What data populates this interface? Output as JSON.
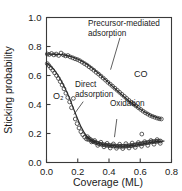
{
  "chart_data": {
    "type": "scatter",
    "title": "",
    "xlabel": "Coverage (ML)",
    "ylabel": "Sticking probability",
    "xlim": [
      0.0,
      0.8
    ],
    "ylim": [
      0.0,
      1.0
    ],
    "xticks": [
      "0.0",
      "0.2",
      "0.4",
      "0.6",
      "0.8"
    ],
    "xtick_values": [
      0.0,
      0.2,
      0.4,
      0.6,
      0.8
    ],
    "yticks": [
      "0.0",
      "0.2",
      "0.4",
      "0.6",
      "0.8",
      "1.0"
    ],
    "ytick_values": [
      0.0,
      0.2,
      0.4,
      0.6,
      0.8,
      1.0
    ],
    "grid": false,
    "legend_position": "none",
    "marker_style": "open-circle",
    "annotations": [
      {
        "name": "precursor-mediated-adsorption",
        "text_line_1": "Precursor-mediated",
        "text_line_2": "adsorption",
        "text": "Precursor-mediated adsorption",
        "leader_from": [
          0.47,
          0.86
        ],
        "leader_to": [
          0.41,
          0.64
        ]
      },
      {
        "name": "direct-adsorption",
        "text_line_1": "Direct",
        "text_line_2": "adsorption",
        "text": "Direct adsorption",
        "leader_from": [
          0.235,
          0.42
        ],
        "leader_to": [
          0.175,
          0.33
        ]
      },
      {
        "name": "oxidation",
        "text_line_1": "Oxidation",
        "text": "Oxidation",
        "leader_from": [
          0.45,
          0.3
        ],
        "leader_to": [
          0.435,
          0.175
        ]
      }
    ],
    "series": [
      {
        "name": "CO",
        "label": "CO",
        "label_position": [
          0.565,
          0.515
        ],
        "mechanism": "Precursor-mediated adsorption",
        "x": [
          0.005,
          0.018,
          0.032,
          0.047,
          0.062,
          0.078,
          0.093,
          0.108,
          0.122,
          0.137,
          0.152,
          0.168,
          0.183,
          0.198,
          0.213,
          0.228,
          0.243,
          0.258,
          0.273,
          0.288,
          0.303,
          0.318,
          0.333,
          0.348,
          0.363,
          0.378,
          0.393,
          0.408,
          0.423,
          0.438,
          0.453,
          0.468,
          0.483,
          0.498,
          0.513,
          0.528,
          0.543,
          0.558,
          0.573,
          0.588,
          0.603,
          0.618,
          0.633,
          0.648,
          0.663,
          0.678,
          0.693,
          0.708,
          0.722,
          0.735
        ],
        "y": [
          0.748,
          0.745,
          0.752,
          0.742,
          0.748,
          0.738,
          0.755,
          0.742,
          0.735,
          0.738,
          0.728,
          0.722,
          0.715,
          0.71,
          0.702,
          0.692,
          0.682,
          0.672,
          0.66,
          0.648,
          0.636,
          0.622,
          0.61,
          0.596,
          0.582,
          0.568,
          0.553,
          0.54,
          0.526,
          0.512,
          0.498,
          0.484,
          0.47,
          0.456,
          0.442,
          0.428,
          0.414,
          0.402,
          0.39,
          0.378,
          0.366,
          0.354,
          0.343,
          0.334,
          0.325,
          0.318,
          0.312,
          0.306,
          0.302,
          0.3
        ],
        "fit_curve": [
          [
            0.0,
            0.748
          ],
          [
            0.1,
            0.744
          ],
          [
            0.18,
            0.722
          ],
          [
            0.26,
            0.678
          ],
          [
            0.34,
            0.608
          ],
          [
            0.42,
            0.528
          ],
          [
            0.5,
            0.45
          ],
          [
            0.58,
            0.382
          ],
          [
            0.66,
            0.33
          ],
          [
            0.735,
            0.3
          ]
        ]
      },
      {
        "name": "O2",
        "label": "O₂",
        "label_position": [
          0.105,
          0.345
        ],
        "mechanism": "Direct adsorption",
        "x": [
          0.005,
          0.016,
          0.028,
          0.04,
          0.052,
          0.064,
          0.076,
          0.088,
          0.1,
          0.112,
          0.124,
          0.136,
          0.148,
          0.16,
          0.172,
          0.184,
          0.196,
          0.208,
          0.22,
          0.232,
          0.244,
          0.256
        ],
        "y": [
          0.682,
          0.668,
          0.652,
          0.636,
          0.618,
          0.6,
          0.58,
          0.558,
          0.534,
          0.508,
          0.478,
          0.448,
          0.418,
          0.378,
          0.442,
          0.3,
          0.268,
          0.238,
          0.212,
          0.192,
          0.175,
          0.162
        ],
        "fit_curve": [
          [
            0.0,
            0.688
          ],
          [
            0.05,
            0.638
          ],
          [
            0.1,
            0.552
          ],
          [
            0.14,
            0.462
          ],
          [
            0.18,
            0.352
          ],
          [
            0.22,
            0.248
          ],
          [
            0.26,
            0.178
          ],
          [
            0.3,
            0.148
          ],
          [
            0.34,
            0.138
          ]
        ]
      },
      {
        "name": "oxidation-plateau",
        "label": "",
        "mechanism": "Oxidation",
        "x": [
          0.262,
          0.272,
          0.282,
          0.292,
          0.3,
          0.31,
          0.32,
          0.33,
          0.34,
          0.35,
          0.36,
          0.37,
          0.38,
          0.39,
          0.4,
          0.41,
          0.42,
          0.43,
          0.44,
          0.45,
          0.46,
          0.47,
          0.48,
          0.49,
          0.5,
          0.51,
          0.52,
          0.53,
          0.54,
          0.55,
          0.56,
          0.57,
          0.58,
          0.59,
          0.6,
          0.61,
          0.62,
          0.63,
          0.64,
          0.65,
          0.66,
          0.67,
          0.68,
          0.69,
          0.7,
          0.71,
          0.72,
          0.73,
          0.268,
          0.288,
          0.308,
          0.328,
          0.348,
          0.368,
          0.388,
          0.408,
          0.428,
          0.448,
          0.468,
          0.488,
          0.508,
          0.528,
          0.548,
          0.568,
          0.588,
          0.608,
          0.628,
          0.648,
          0.668,
          0.688,
          0.708,
          0.728,
          0.61
        ],
        "y": [
          0.178,
          0.166,
          0.158,
          0.15,
          0.144,
          0.14,
          0.136,
          0.132,
          0.128,
          0.126,
          0.124,
          0.122,
          0.12,
          0.118,
          0.118,
          0.116,
          0.116,
          0.114,
          0.114,
          0.112,
          0.112,
          0.112,
          0.112,
          0.112,
          0.112,
          0.114,
          0.114,
          0.116,
          0.116,
          0.118,
          0.12,
          0.122,
          0.124,
          0.126,
          0.128,
          0.13,
          0.132,
          0.134,
          0.136,
          0.138,
          0.14,
          0.142,
          0.144,
          0.144,
          0.146,
          0.146,
          0.148,
          0.148,
          0.158,
          0.142,
          0.152,
          0.118,
          0.14,
          0.108,
          0.132,
          0.1,
          0.128,
          0.098,
          0.126,
          0.096,
          0.13,
          0.1,
          0.134,
          0.104,
          0.138,
          0.112,
          0.144,
          0.118,
          0.152,
          0.126,
          0.158,
          0.132,
          0.196
        ],
        "fit_curve": [
          [
            0.255,
            0.182
          ],
          [
            0.3,
            0.142
          ],
          [
            0.36,
            0.124
          ],
          [
            0.42,
            0.116
          ],
          [
            0.48,
            0.112
          ],
          [
            0.54,
            0.116
          ],
          [
            0.6,
            0.126
          ],
          [
            0.66,
            0.138
          ],
          [
            0.72,
            0.146
          ],
          [
            0.755,
            0.148
          ]
        ]
      }
    ]
  }
}
